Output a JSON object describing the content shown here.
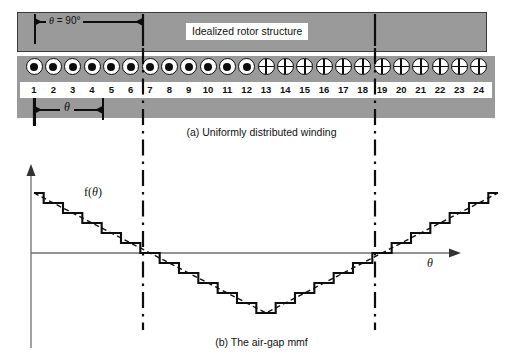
{
  "figure": {
    "title_a": "(a) Uniformly distributed winding",
    "title_b": "(b) The air-gap mmf"
  },
  "part_a": {
    "rotor_label": "Idealized rotor structure",
    "angle_annotation": "θ = 90°",
    "theta_annotation": "θ",
    "slot_numbers": [
      "1",
      "2",
      "3",
      "4",
      "5",
      "6",
      "7",
      "8",
      "9",
      "10",
      "11",
      "12",
      "13",
      "14",
      "15",
      "16",
      "17",
      "18",
      "19",
      "20",
      "21",
      "22",
      "23",
      "24"
    ],
    "conductor_symbols": [
      "dot",
      "dot",
      "dot",
      "dot",
      "dot",
      "dot",
      "dot",
      "dot",
      "dot",
      "dot",
      "dot",
      "dot",
      "cross",
      "cross",
      "cross",
      "cross",
      "cross",
      "cross",
      "cross",
      "cross",
      "cross",
      "cross",
      "cross",
      "cross"
    ],
    "band_color": "#9a9a9a",
    "reference_slots": [
      7,
      19
    ],
    "theta_arrow_from_slot": 1,
    "theta_arrow_to_slot": 5
  },
  "part_b": {
    "y_axis_label": "f(θ)",
    "x_axis_label": "θ",
    "reference_slots": [
      7,
      19
    ]
  },
  "chart_data": {
    "type": "line",
    "title": "(b) The air-gap mmf",
    "xlabel": "θ",
    "ylabel": "f(θ)",
    "grid": false,
    "legend": "none",
    "xlim": [
      0,
      24
    ],
    "ylim": [
      -6,
      6
    ],
    "series": [
      {
        "name": "Stepped mmf (staircase)",
        "style": "solid",
        "x": [
          0,
          1,
          2,
          3,
          4,
          5,
          6,
          7,
          8,
          9,
          10,
          11,
          12,
          13,
          14,
          15,
          16,
          17,
          18,
          19,
          20,
          21,
          22,
          23,
          24
        ],
        "values": [
          6,
          5,
          4,
          3,
          2,
          1,
          0,
          -1,
          -2,
          -3,
          -4,
          -5,
          -6,
          -5,
          -4,
          -3,
          -2,
          -1,
          0,
          1,
          2,
          3,
          4,
          5,
          6
        ],
        "note": "Value held constant between successive slots, dropping by one unit at each slot 1-12 and rising by one unit at each slot 13-24."
      },
      {
        "name": "Ideal triangular mmf",
        "style": "dashed",
        "x": [
          0,
          12,
          24
        ],
        "values": [
          6,
          -6,
          6
        ],
        "note": "Dashed straight-line triangular approximation drawn through the mid-points of the staircase."
      }
    ],
    "zero_crossings": [
      6,
      18
    ],
    "peak_positive_at": [
      0,
      24
    ],
    "peak_negative_at": 12
  }
}
